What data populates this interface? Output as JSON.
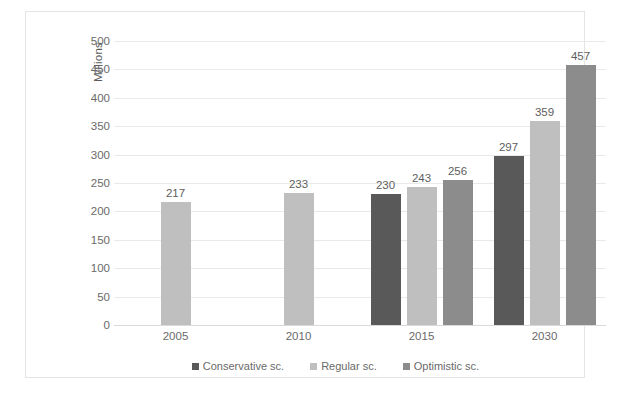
{
  "chart_data": {
    "type": "bar",
    "title": "",
    "subtitle": "",
    "xlabel": "",
    "ylabel": "Millions",
    "ylim": [
      0,
      500
    ],
    "ytick_step": 50,
    "yticks": [
      "500",
      "450",
      "400",
      "350",
      "300",
      "250",
      "200",
      "150",
      "100",
      "50",
      "0"
    ],
    "grid": true,
    "legend_position": "bottom",
    "categories": [
      "2005",
      "2010",
      "2015",
      "2030"
    ],
    "series": [
      {
        "name": "Conservative sc.",
        "color": "#595959",
        "values": [
          null,
          null,
          230,
          297
        ],
        "labels": [
          "",
          "",
          "230",
          "297"
        ]
      },
      {
        "name": "Regular sc.",
        "color": "#bfbfbf",
        "values": [
          217,
          233,
          243,
          359
        ],
        "labels": [
          "217",
          "233",
          "243",
          "359"
        ]
      },
      {
        "name": "Optimistic sc.",
        "color": "#8c8c8c",
        "values": [
          null,
          null,
          256,
          457
        ],
        "labels": [
          "",
          "",
          "256",
          "457"
        ]
      }
    ]
  },
  "colors": {
    "conservative": "#595959",
    "regular": "#bfbfbf",
    "optimistic": "#8c8c8c",
    "gridline": "#e9e9e9",
    "frame_border": "#e4e4e4",
    "text": "#6a6a6a",
    "background": "#ffffff"
  }
}
